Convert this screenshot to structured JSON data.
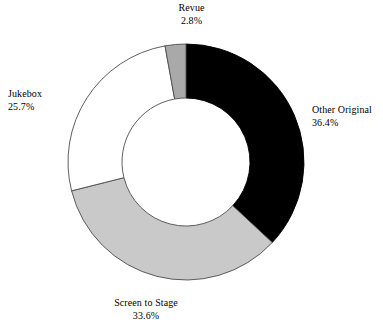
{
  "chart_data": {
    "type": "pie",
    "variant": "donut",
    "title": "",
    "subtitle": "",
    "xlabel": "",
    "ylabel": "",
    "legend": "none",
    "grid": false,
    "labels_position": "outside",
    "value_unit": "percent",
    "start_angle_deg": 0,
    "direction": "clockwise",
    "center_x": 186,
    "center_y": 162,
    "outer_radius": 118,
    "inner_radius": 64,
    "categories": [
      "Other Original",
      "Screen to Stage",
      "Jukebox",
      "Revue"
    ],
    "values": [
      36.4,
      33.6,
      25.7,
      2.8
    ],
    "slices": [
      {
        "name": "Other Original",
        "value": 36.4,
        "value_label": "36.4%",
        "color": "#000000",
        "stroke": "#000000"
      },
      {
        "name": "Screen to Stage",
        "value": 33.6,
        "value_label": "33.6%",
        "color": "#c9c9c9",
        "stroke": "#4d4d4d"
      },
      {
        "name": "Jukebox",
        "value": 25.7,
        "value_label": "25.7%",
        "color": "#ffffff",
        "stroke": "#4d4d4d"
      },
      {
        "name": "Revue",
        "value": 2.8,
        "value_label": "2.8%",
        "color": "#a9a9a9",
        "stroke": "#4d4d4d"
      }
    ]
  },
  "labels": {
    "revue": {
      "name": "Revue",
      "value": "2.8%"
    },
    "other_original": {
      "name": "Other Original",
      "value": "36.4%"
    },
    "jukebox": {
      "name": "Jukebox",
      "value": "25.7%"
    },
    "screen_to_stage": {
      "name": "Screen to Stage",
      "value": "33.6%"
    }
  },
  "colors": {
    "background": "#ffffff",
    "text": "#000000",
    "black_slice": "#000000",
    "light_gray_slice": "#c9c9c9",
    "medium_gray_slice": "#a9a9a9",
    "white_slice": "#ffffff",
    "outline": "#4d4d4d"
  }
}
